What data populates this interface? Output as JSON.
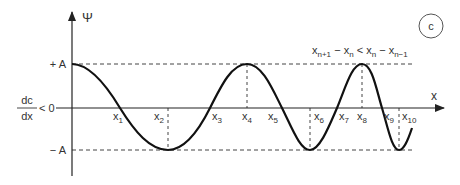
{
  "diagram": {
    "panel_label": "c",
    "y_axis_label": "Ψ",
    "x_axis_label": "x",
    "amplitude_labels": {
      "plus": "+ A",
      "minus": "− A"
    },
    "gradient_label": {
      "numerator": "dc",
      "denominator": "dx",
      "relation": "< 0"
    },
    "condition": {
      "parts": [
        {
          "base": "x",
          "sub": "n+1"
        },
        {
          "op": " − "
        },
        {
          "base": "x",
          "sub": "n"
        },
        {
          "op": " < "
        },
        {
          "base": "x",
          "sub": "n"
        },
        {
          "op": " − "
        },
        {
          "base": "x",
          "sub": "n−1"
        }
      ],
      "text": "x_{n+1} − x_n < x_n − x_{n−1}"
    },
    "points": [
      {
        "base": "x",
        "sub": "1"
      },
      {
        "base": "x",
        "sub": "2"
      },
      {
        "base": "x",
        "sub": "3"
      },
      {
        "base": "x",
        "sub": "4"
      },
      {
        "base": "x",
        "sub": "5"
      },
      {
        "base": "x",
        "sub": "6"
      },
      {
        "base": "x",
        "sub": "7"
      },
      {
        "base": "x",
        "sub": "8"
      },
      {
        "base": "x",
        "sub": "9"
      },
      {
        "base": "x",
        "sub": "10"
      }
    ],
    "colors": {
      "curve": "#111111",
      "axis": "#333333",
      "dashed": "#444444",
      "text": "#333333"
    }
  }
}
